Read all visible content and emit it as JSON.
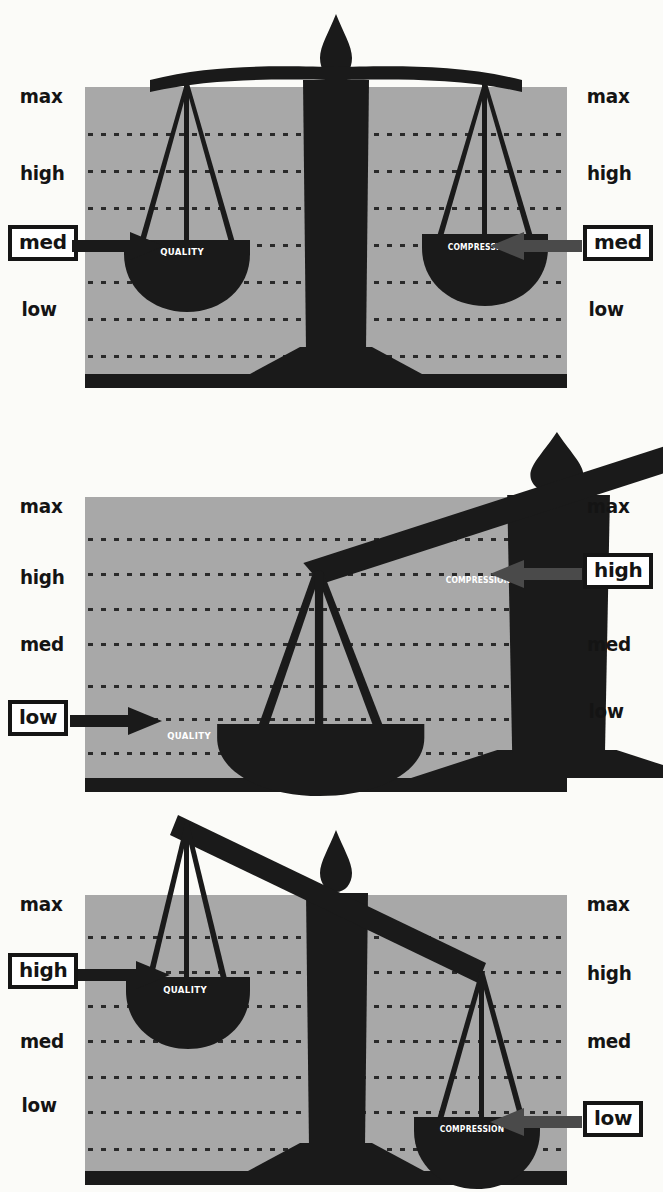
{
  "figure": {
    "colors": {
      "field_gray": "#a8a8a8",
      "ink_black": "#1a1a1a",
      "box_fill": "#ffffff",
      "page": "#fbfbf8",
      "caption_text": "#ffffff"
    },
    "scale_axis_labels": [
      "max",
      "high",
      "med",
      "low"
    ],
    "pan_names": {
      "left": "QUALITY",
      "right": "COMPRESSION"
    }
  },
  "panels": [
    {
      "id": "panel-balanced",
      "state": "balanced",
      "left": {
        "pan_label": "QUALITY",
        "ticks": [
          "max",
          "high",
          "med",
          "low"
        ],
        "selected": "med",
        "boxed_label": "med",
        "arrow_direction": "right"
      },
      "right": {
        "pan_label": "COMPRESSION",
        "ticks": [
          "max",
          "high",
          "med",
          "low"
        ],
        "selected": "med",
        "boxed_label": "med",
        "arrow_direction": "left"
      }
    },
    {
      "id": "panel-low-quality",
      "state": "tilted-left-down",
      "left": {
        "pan_label": "QUALITY",
        "ticks": [
          "max",
          "high",
          "med",
          "low"
        ],
        "selected": "low",
        "boxed_label": "low",
        "arrow_direction": "right"
      },
      "right": {
        "pan_label": "COMPRESSION",
        "ticks": [
          "max",
          "high",
          "med",
          "low"
        ],
        "selected": "high",
        "boxed_label": "high",
        "arrow_direction": "left"
      }
    },
    {
      "id": "panel-high-quality",
      "state": "tilted-right-down",
      "left": {
        "pan_label": "QUALITY",
        "ticks": [
          "max",
          "high",
          "med",
          "low"
        ],
        "selected": "high",
        "boxed_label": "high",
        "arrow_direction": "right"
      },
      "right": {
        "pan_label": "COMPRESSION",
        "ticks": [
          "max",
          "high",
          "med",
          "low"
        ],
        "selected": "low",
        "boxed_label": "low",
        "arrow_direction": "left"
      }
    }
  ]
}
